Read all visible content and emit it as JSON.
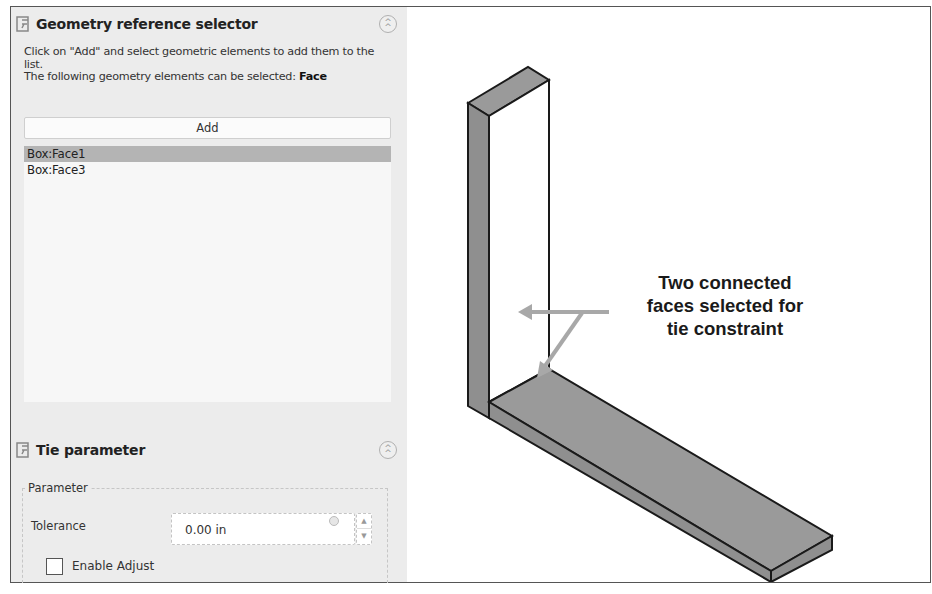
{
  "geometry_selector": {
    "title": "Geometry reference selector",
    "instruction_line1": "Click on \"Add\" and select geometric elements to add them to the list.",
    "instruction_line2_prefix": "The following geometry elements can be selected: ",
    "instruction_line2_type": "Face",
    "add_label": "Add",
    "references": [
      {
        "label": "Box:Face1",
        "selected": true
      },
      {
        "label": "Box:Face3",
        "selected": false
      }
    ]
  },
  "tie_parameter": {
    "title": "Tie parameter",
    "group_label": "Parameter",
    "tolerance_label": "Tolerance",
    "tolerance_value": "0.00 in",
    "enable_adjust_label": "Enable Adjust",
    "enable_adjust_checked": false
  },
  "viewport": {
    "annotation_lines": [
      "Two connected",
      "faces selected for",
      "tie constraint"
    ],
    "colors": {
      "selected_face": "#9a9a9a",
      "side_face": "#8f8f8f",
      "unselected_face": "#ffffff",
      "arrow": "#a8a8a8",
      "edge": "#1a1a1a"
    }
  }
}
